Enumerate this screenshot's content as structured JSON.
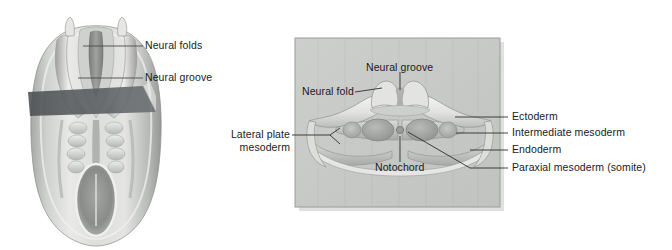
{
  "figure": {
    "panels": {
      "left": {
        "name": "dorsal-view-embryo",
        "labels": [
          {
            "id": "neural-folds",
            "text": "Neural folds"
          },
          {
            "id": "neural-groove",
            "text": "Neural groove"
          }
        ],
        "cutting_plane": {
          "name": "section-plane",
          "color": "#53565a"
        }
      },
      "right": {
        "name": "transverse-section-panel",
        "background_color": "#c9cbc9",
        "border_color": "#9a9c9a",
        "labels_inside_top": [
          {
            "id": "neural-groove",
            "text": "Neural groove"
          },
          {
            "id": "neural-fold",
            "text": "Neural fold"
          }
        ],
        "labels_inside_bottom": [
          {
            "id": "notochord",
            "text": "Notochord"
          }
        ],
        "labels_left": [
          {
            "id": "lateral-plate-mesoderm",
            "line1": "Lateral plate",
            "line2": "mesoderm"
          }
        ],
        "labels_right": [
          {
            "id": "ectoderm",
            "text": "Ectoderm"
          },
          {
            "id": "intermediate-mesoderm",
            "text": "Intermediate mesoderm"
          },
          {
            "id": "endoderm",
            "text": "Endoderm"
          },
          {
            "id": "paraxial-mesoderm",
            "text": "Paraxial mesoderm (somite)"
          }
        ]
      }
    },
    "colors": {
      "leader_line": "#4a4a4a",
      "tissue_light": "#e8e8e6",
      "tissue_mid": "#b9bbb9",
      "tissue_dark": "#8c8e8c",
      "text": "#1a1a1a"
    }
  }
}
